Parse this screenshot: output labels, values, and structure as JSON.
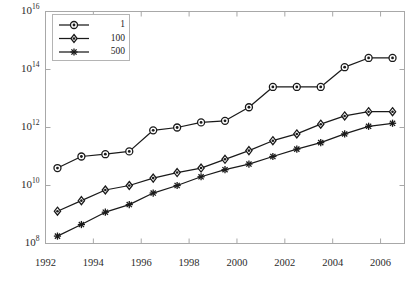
{
  "chart_data": {
    "type": "line",
    "title": "",
    "xlabel": "",
    "ylabel": "",
    "xlim": [
      1992.0,
      2007.0
    ],
    "ylim": [
      100000000.0,
      1e+16
    ],
    "yscale": "log",
    "grid": false,
    "legend_position": "top-left",
    "x_ticks": [
      "1992",
      "1994",
      "1996",
      "1998",
      "2000",
      "2002",
      "2004",
      "2006"
    ],
    "x_tick_values": [
      1992,
      1994,
      1996,
      1998,
      2000,
      2002,
      2004,
      2006
    ],
    "y_ticks": [
      "10^16",
      "10^14",
      "10^12",
      "10^10",
      "10^8"
    ],
    "y_tick_values": [
      1e+16,
      100000000000000.0,
      1000000000000.0,
      10000000000.0,
      100000000.0
    ],
    "y_tick_mantissa": [
      "10",
      "10",
      "10",
      "10",
      "10"
    ],
    "y_tick_exponent": [
      "16",
      "14",
      "12",
      "10",
      "8"
    ],
    "x": [
      1992.5,
      1993.5,
      1994.5,
      1995.5,
      1996.5,
      1997.5,
      1998.5,
      1999.5,
      2000.5,
      2001.5,
      2002.5,
      2003.5,
      2004.5,
      2005.5,
      2006.5
    ],
    "series": [
      {
        "name": "1",
        "marker": "circle",
        "color": "#1a1a1a",
        "values": [
          40000000000.0,
          100000000000.0,
          120000000000.0,
          150000000000.0,
          800000000000.0,
          1000000000000.0,
          1500000000000.0,
          1700000000000.0,
          5000000000000.0,
          25000000000000.0,
          25000000000000.0,
          25000000000000.0,
          120000000000000.0,
          250000000000000.0,
          250000000000000.0
        ]
      },
      {
        "name": "100",
        "marker": "diamond",
        "color": "#1a1a1a",
        "values": [
          1300000000.0,
          3000000000.0,
          7000000000.0,
          10000000000.0,
          18000000000.0,
          28000000000.0,
          40000000000.0,
          80000000000.0,
          160000000000.0,
          350000000000.0,
          600000000000.0,
          1300000000000.0,
          2500000000000.0,
          3500000000000.0,
          3500000000000.0
        ]
      },
      {
        "name": "500",
        "marker": "asterisk",
        "color": "#1a1a1a",
        "values": [
          180000000.0,
          450000000.0,
          1200000000.0,
          2200000000.0,
          5500000000.0,
          10000000000.0,
          20000000000.0,
          35000000000.0,
          55000000000.0,
          100000000000.0,
          180000000000.0,
          300000000000.0,
          600000000000.0,
          1100000000000.0,
          1400000000000.0
        ]
      }
    ]
  },
  "legend": {
    "entries": [
      {
        "label": "1"
      },
      {
        "label": "100"
      },
      {
        "label": "500"
      }
    ]
  },
  "axes": {
    "frame_color": "#a8a8a8",
    "text_color": "#2b2b2b"
  }
}
